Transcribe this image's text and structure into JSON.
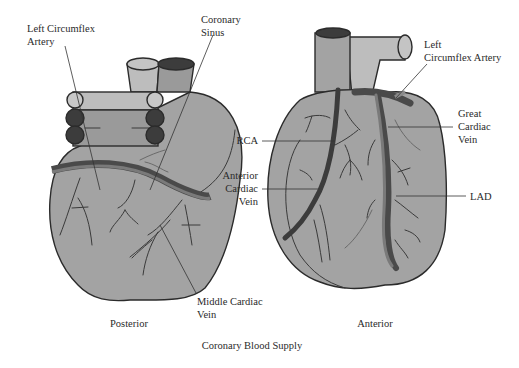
{
  "diagram": {
    "title": "Coronary Blood Supply",
    "colors": {
      "heart_fill": "#a3a3a3",
      "heart_outline": "#2b2b2b",
      "vessel_light": "#bdbdbd",
      "vessel_mid": "#9a9a9a",
      "vessel_dark": "#3c3c3c",
      "artery_band": "#5a5a5a",
      "vein_band": "#7a7a7a"
    },
    "views": [
      {
        "name": "Posterior",
        "labels": [
          {
            "id": "left-circumflex-artery",
            "lines": [
              "Left Circumflex",
              "Artery"
            ]
          },
          {
            "id": "coronary-sinus",
            "lines": [
              "Coronary",
              "Sinus"
            ]
          },
          {
            "id": "middle-cardiac-vein",
            "lines": [
              "Middle Cardiac",
              "Vein"
            ]
          }
        ]
      },
      {
        "name": "Anterior",
        "labels": [
          {
            "id": "rca",
            "lines": [
              "RCA"
            ]
          },
          {
            "id": "anterior-cardiac-vein",
            "lines": [
              "Anterior",
              "Cardiac",
              "Vein"
            ]
          },
          {
            "id": "left-circumflex-artery-anterior",
            "lines": [
              "Left",
              "Circumflex Artery"
            ]
          },
          {
            "id": "great-cardiac-vein",
            "lines": [
              "Great",
              "Cardiac",
              "Vein"
            ]
          },
          {
            "id": "lad",
            "lines": [
              "LAD"
            ]
          }
        ]
      }
    ]
  }
}
